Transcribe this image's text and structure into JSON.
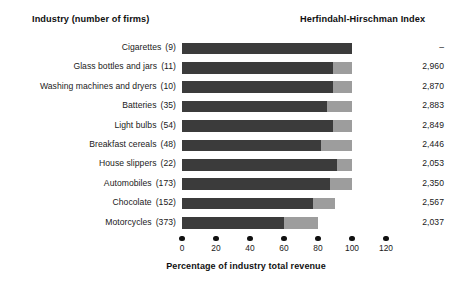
{
  "header": {
    "industry_title": "Industry (number of firms)",
    "hhi_title": "Herfindahl-Hirschman Index"
  },
  "axis": {
    "title": "Percentage of industry total revenue",
    "ticks": [
      "0",
      "20",
      "40",
      "60",
      "80",
      "100",
      "120"
    ]
  },
  "colors": {
    "dark_segment": "#3b3b3b",
    "light_segment": "#9d9d9d",
    "text": "#1a1a1a",
    "background": "#ffffff"
  },
  "rows": [
    {
      "industry": "Cigarettes",
      "firms": "(9)",
      "hhi": "–",
      "dark": 100,
      "light": 0,
      "total": 100
    },
    {
      "industry": "Glass bottles and jars",
      "firms": "(11)",
      "hhi": "2,960",
      "dark": 89,
      "light": 11,
      "total": 100
    },
    {
      "industry": "Washing machines and dryers",
      "firms": "(10)",
      "hhi": "2,870",
      "dark": 89,
      "light": 11,
      "total": 100
    },
    {
      "industry": "Batteries",
      "firms": "(35)",
      "hhi": "2,883",
      "dark": 85,
      "light": 15,
      "total": 100
    },
    {
      "industry": "Light bulbs",
      "firms": "(54)",
      "hhi": "2,849",
      "dark": 89,
      "light": 11,
      "total": 100
    },
    {
      "industry": "Breakfast cereals",
      "firms": "(48)",
      "hhi": "2,446",
      "dark": 82,
      "light": 18,
      "total": 100
    },
    {
      "industry": "House slippers",
      "firms": "(22)",
      "hhi": "2,053",
      "dark": 91,
      "light": 9,
      "total": 100
    },
    {
      "industry": "Automobiles",
      "firms": "(173)",
      "hhi": "2,350",
      "dark": 87,
      "light": 13,
      "total": 100
    },
    {
      "industry": "Chocolate",
      "firms": "(152)",
      "hhi": "2,567",
      "dark": 77,
      "light": 13,
      "total": 90
    },
    {
      "industry": "Motorcycles",
      "firms": "(373)",
      "hhi": "2,037",
      "dark": 60,
      "light": 20,
      "total": 80
    }
  ],
  "chart_data": {
    "type": "bar",
    "orientation": "horizontal",
    "stacked": true,
    "xlabel": "Percentage of industry total revenue",
    "ylabel": "Industry (number of firms)",
    "xlim": [
      0,
      120
    ],
    "xticks": [
      0,
      20,
      40,
      60,
      80,
      100,
      120
    ],
    "grid": false,
    "legend": "none",
    "categories": [
      "Cigarettes (9)",
      "Glass bottles and jars (11)",
      "Washing machines and dryers (10)",
      "Batteries (35)",
      "Light bulbs (54)",
      "Breakfast cereals (48)",
      "House slippers (22)",
      "Automobiles (173)",
      "Chocolate (152)",
      "Motorcycles (373)"
    ],
    "series": [
      {
        "name": "Four largest firms share",
        "color": "#3b3b3b",
        "values": [
          100,
          89,
          89,
          85,
          89,
          82,
          91,
          87,
          77,
          60
        ]
      },
      {
        "name": "Remaining firms share",
        "color": "#9d9d9d",
        "values": [
          0,
          11,
          11,
          15,
          11,
          18,
          9,
          13,
          13,
          20
        ]
      }
    ],
    "annotations": {
      "column_label": "Herfindahl-Hirschman Index",
      "values": [
        "–",
        "2,960",
        "2,870",
        "2,883",
        "2,849",
        "2,446",
        "2,053",
        "2,350",
        "2,567",
        "2,037"
      ],
      "number_of_firms": [
        9,
        11,
        10,
        35,
        54,
        48,
        22,
        173,
        152,
        373
      ]
    }
  }
}
